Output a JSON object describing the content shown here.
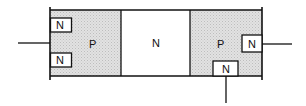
{
  "diagram": {
    "type": "semiconductor-structure",
    "regions": [
      {
        "id": "left-p",
        "label": "P",
        "doping": "P",
        "shaded": true
      },
      {
        "id": "middle-n",
        "label": "N",
        "doping": "N",
        "shaded": false
      },
      {
        "id": "right-p",
        "label": "P",
        "doping": "P",
        "shaded": true
      }
    ],
    "contacts": [
      {
        "id": "left-top-n",
        "label": "N",
        "in_region": "left-p"
      },
      {
        "id": "left-bottom-n",
        "label": "N",
        "in_region": "left-p"
      },
      {
        "id": "right-side-n",
        "label": "N",
        "in_region": "right-p"
      },
      {
        "id": "right-bottom-n",
        "label": "N",
        "in_region": "right-p"
      }
    ],
    "terminals": [
      "left-lead",
      "right-lead",
      "bottom-lead"
    ],
    "colors": {
      "shade": "#d9d9d9",
      "line": "#111111",
      "background": "#ffffff"
    }
  }
}
